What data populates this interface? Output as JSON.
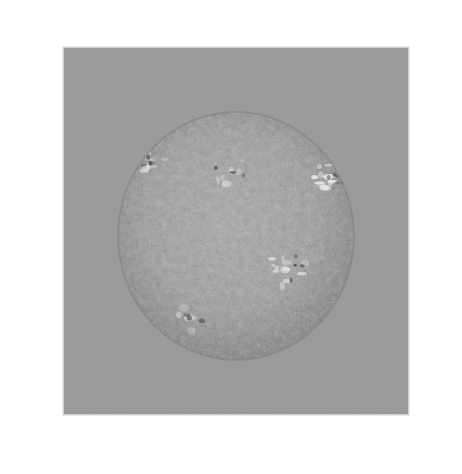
{
  "figure": {
    "name": "solar-magnetic-field-extrapolation",
    "canvas": {
      "width": 462,
      "height": 474,
      "background_color": "#ffffff"
    },
    "panel": {
      "name": "field-of-view-panel",
      "x": 64,
      "y": 48,
      "width": 344,
      "height": 366,
      "fill_color": "#9a9a9a",
      "edge_highlight_color": "#cfcfcf"
    },
    "solar_disk": {
      "name": "solar-disk",
      "center_x": 236,
      "center_y": 236,
      "radius_x": 118,
      "radius_y": 124,
      "base_color": "#8e8e8e",
      "limb_darkening": true,
      "description": "mottled photospheric granulation with bright plage"
    },
    "annotation_box": {
      "name": "region-of-interest-box",
      "x": 272,
      "y": 258,
      "width": 46,
      "height": 26,
      "stroke_color": "#e8e8e8",
      "fill_color": "#101010",
      "stroke_width": 1.2
    },
    "field_lines": {
      "dark_color": "#2e2e2e",
      "light_color": "#f2f2f2",
      "mid_color": "#555555",
      "open_line_color": "#4a4a4a",
      "stroke_width_min": 0.45,
      "stroke_width_max": 1.05
    },
    "active_regions": [
      {
        "name": "active-region-north-west",
        "cx": 148,
        "cy": 160,
        "r": 22,
        "brightness": "high"
      },
      {
        "name": "active-region-north-center",
        "cx": 232,
        "cy": 172,
        "r": 26,
        "brightness": "medium"
      },
      {
        "name": "active-region-east-limb",
        "cx": 330,
        "cy": 178,
        "r": 20,
        "brightness": "very-high"
      },
      {
        "name": "active-region-core",
        "cx": 288,
        "cy": 268,
        "r": 24,
        "brightness": "high"
      },
      {
        "name": "active-region-south",
        "cx": 190,
        "cy": 318,
        "r": 18,
        "brightness": "medium"
      }
    ],
    "legend": {
      "visible": false,
      "items": []
    },
    "labels": {
      "title": "",
      "caption": "",
      "axis_labels": []
    }
  }
}
